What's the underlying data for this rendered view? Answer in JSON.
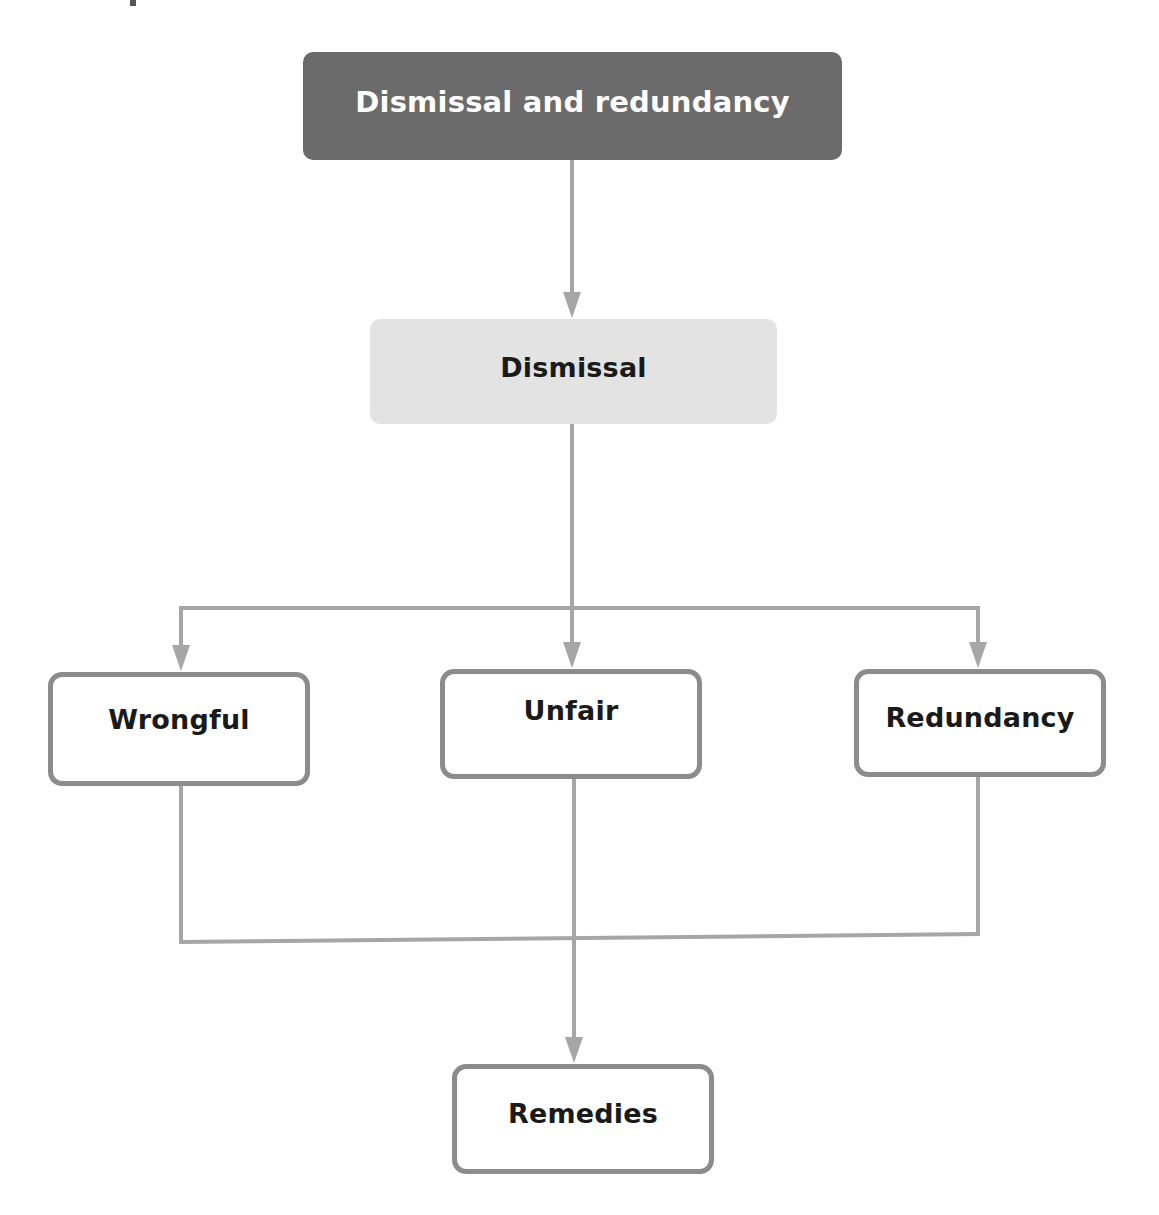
{
  "diagram": {
    "type": "flowchart",
    "direction": "top-down",
    "colors": {
      "root_fill": "#6b6b6b",
      "root_text": "#ffffff",
      "secondary_fill": "#e3e3e3",
      "node_border": "#8c8c8c",
      "node_text": "#1a1a1a",
      "connector": "#a6a6a6",
      "background": "#ffffff"
    },
    "nodes": {
      "root": {
        "label": "Dismissal and redundancy"
      },
      "dismissal": {
        "label": "Dismissal"
      },
      "wrongful": {
        "label": "Wrongful"
      },
      "unfair": {
        "label": "Unfair"
      },
      "redundancy": {
        "label": "Redundancy"
      },
      "remedies": {
        "label": "Remedies"
      }
    },
    "edges": [
      {
        "from": "Dismissal and redundancy",
        "to": "Dismissal"
      },
      {
        "from": "Dismissal",
        "to": "Wrongful"
      },
      {
        "from": "Dismissal",
        "to": "Unfair"
      },
      {
        "from": "Dismissal",
        "to": "Redundancy"
      },
      {
        "from": "Wrongful",
        "to": "Remedies"
      },
      {
        "from": "Unfair",
        "to": "Remedies"
      },
      {
        "from": "Redundancy",
        "to": "Remedies"
      }
    ]
  }
}
